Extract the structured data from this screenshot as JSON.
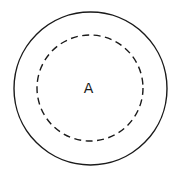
{
  "diagram": {
    "outer_circle": {
      "style": "solid",
      "cx": 90.5,
      "cy": 88.5,
      "r": 76.5,
      "color": "#1a1a1a"
    },
    "inner_circle": {
      "style": "dashed",
      "cx": 90,
      "cy": 88,
      "r": 53,
      "color": "#1a1a1a"
    },
    "center_label": "A"
  }
}
